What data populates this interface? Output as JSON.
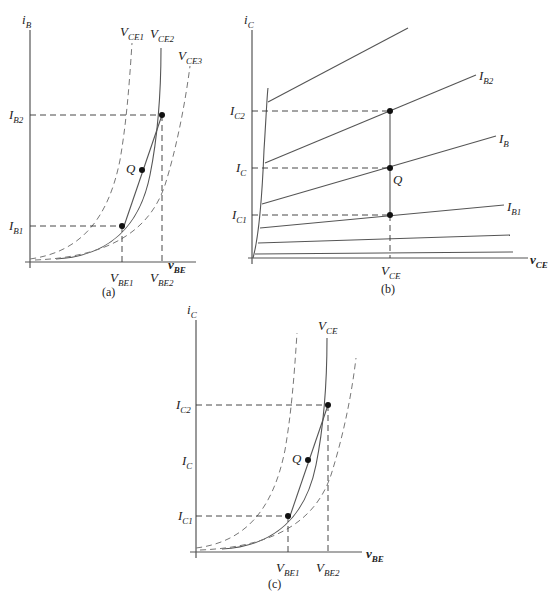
{
  "figure": {
    "panels": [
      {
        "id": "a",
        "caption": "(a)",
        "y_axis": {
          "main": "i",
          "sub": "B"
        },
        "x_axis": {
          "main": "v",
          "sub": "BE"
        },
        "curves": [
          {
            "main": "V",
            "sub": "CE1",
            "style": "dashed"
          },
          {
            "main": "V",
            "sub": "CE2",
            "style": "solid"
          },
          {
            "main": "V",
            "sub": "CE3",
            "style": "dashed"
          }
        ],
        "y_ticks": [
          {
            "main": "I",
            "sub": "B2"
          },
          {
            "main": "I",
            "sub": "B1"
          }
        ],
        "x_ticks": [
          {
            "main": "V",
            "sub": "BE1"
          },
          {
            "main": "V",
            "sub": "BE2"
          }
        ],
        "point": "Q"
      },
      {
        "id": "b",
        "caption": "(b)",
        "y_axis": {
          "main": "i",
          "sub": "C"
        },
        "x_axis": {
          "main": "v",
          "sub": "CE"
        },
        "curves": [
          {
            "main": "I",
            "sub": "B2"
          },
          {
            "main": "I",
            "sub": "B"
          },
          {
            "main": "I",
            "sub": "B1"
          }
        ],
        "y_ticks": [
          {
            "main": "I",
            "sub": "C2"
          },
          {
            "main": "I",
            "sub": "C"
          },
          {
            "main": "I",
            "sub": "C1"
          }
        ],
        "x_ticks": [
          {
            "main": "V",
            "sub": "CE"
          }
        ],
        "point": "Q"
      },
      {
        "id": "c",
        "caption": "(c)",
        "y_axis": {
          "main": "i",
          "sub": "C"
        },
        "x_axis": {
          "main": "v",
          "sub": "BE"
        },
        "curves": [
          {
            "main": "V",
            "sub": "CE",
            "style": "solid"
          }
        ],
        "y_ticks": [
          {
            "main": "I",
            "sub": "C2"
          },
          {
            "main": "I",
            "sub": "C"
          },
          {
            "main": "I",
            "sub": "C1"
          }
        ],
        "x_ticks": [
          {
            "main": "V",
            "sub": "BE1"
          },
          {
            "main": "V",
            "sub": "BE2"
          }
        ],
        "point": "Q"
      }
    ]
  }
}
